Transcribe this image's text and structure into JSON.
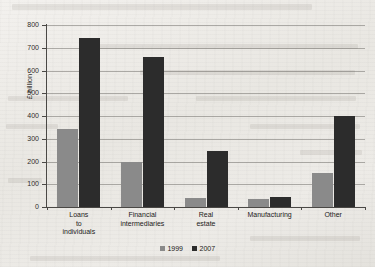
{
  "chart_data": {
    "type": "bar",
    "title": "",
    "xlabel": "",
    "ylabel": "£ billion",
    "ylim": [
      0,
      800
    ],
    "ytick_step": 100,
    "grid": true,
    "legend_position": "bottom",
    "categories": [
      "Loans to individuals",
      "Financial intermediaries",
      "Real estate",
      "Manufacturing",
      "Other"
    ],
    "category_lines": [
      [
        "Loans",
        "to",
        "individuals"
      ],
      [
        "Financial",
        "intermediaries"
      ],
      [
        "Real",
        "estate"
      ],
      [
        "Manufacturing"
      ],
      [
        "Other"
      ]
    ],
    "series": [
      {
        "name": "1999",
        "color": "#8a8a8a",
        "values": [
          345,
          200,
          40,
          35,
          150
        ]
      },
      {
        "name": "2007",
        "color": "#2c2c2c",
        "values": [
          745,
          660,
          245,
          45,
          400
        ]
      }
    ],
    "ytick_labels": [
      "0",
      "100",
      "200",
      "300",
      "400",
      "500",
      "600",
      "700",
      "800"
    ]
  },
  "legend": {
    "items": [
      {
        "label": "1999",
        "color": "#8a8a8a"
      },
      {
        "label": "2007",
        "color": "#2c2c2c"
      }
    ]
  }
}
